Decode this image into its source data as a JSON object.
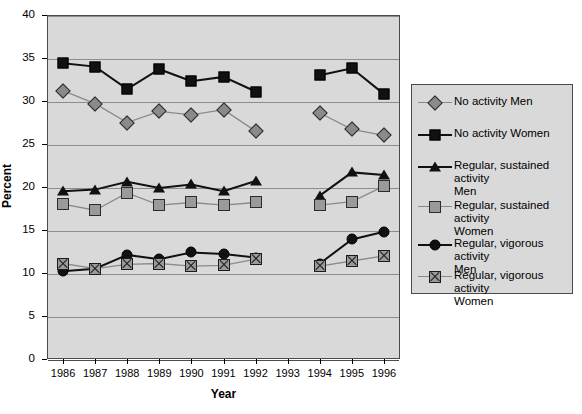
{
  "axes": {
    "y_label": "Percent",
    "x_label": "Year",
    "y_ticks": [
      "0",
      "5",
      "10",
      "15",
      "20",
      "25",
      "30",
      "35",
      "40"
    ],
    "x_ticks": [
      "1986",
      "1987",
      "1988",
      "1989",
      "1990",
      "1991",
      "1992",
      "1993",
      "1994",
      "1995",
      "1996"
    ]
  },
  "legend": {
    "items": [
      {
        "label": "No activity Men",
        "marker": "diamond-gray",
        "line_color": "#8a8a8a"
      },
      {
        "label": "No activity Women",
        "marker": "square-black",
        "line_color": "#111111"
      },
      {
        "label": "Regular, sustained activity\nMen",
        "marker": "triangle-black",
        "line_color": "#111111"
      },
      {
        "label": "Regular, sustained activity\nWomen",
        "marker": "square-gray",
        "line_color": "#8a8a8a"
      },
      {
        "label": "Regular, vigorous activity\nMen",
        "marker": "circle-black",
        "line_color": "#111111"
      },
      {
        "label": "Regular, vigorous activity\nWomen",
        "marker": "square-crossed-gray",
        "line_color": "#8a8a8a"
      }
    ]
  },
  "chart_data": {
    "type": "line",
    "title": "",
    "xlabel": "Year",
    "ylabel": "Percent",
    "ylim": [
      0,
      40
    ],
    "ytick_step": 5,
    "grid": true,
    "legend_position": "right",
    "x": [
      1986,
      1987,
      1988,
      1989,
      1990,
      1991,
      1992,
      1993,
      1994,
      1995,
      1996
    ],
    "note": "No data plotted for 1993 (gap in all series)",
    "series": [
      {
        "name": "No activity Men",
        "marker": "diamond-gray",
        "color": "#8a8a8a",
        "values": [
          31.2,
          29.7,
          27.5,
          28.8,
          28.4,
          29.0,
          26.5,
          null,
          28.6,
          26.7,
          26.0
        ]
      },
      {
        "name": "No activity Women",
        "marker": "square-black",
        "color": "#111111",
        "values": [
          34.4,
          34.0,
          31.4,
          33.7,
          32.3,
          32.8,
          31.1,
          null,
          33.0,
          33.8,
          30.8
        ]
      },
      {
        "name": "Regular, sustained activity Men",
        "marker": "triangle-black",
        "color": "#111111",
        "values": [
          19.5,
          19.7,
          20.6,
          19.9,
          20.3,
          19.5,
          20.7,
          null,
          19.0,
          21.7,
          21.4
        ]
      },
      {
        "name": "Regular, sustained activity Women",
        "marker": "square-gray",
        "color": "#8a8a8a",
        "values": [
          18.0,
          17.3,
          19.3,
          17.9,
          18.2,
          17.9,
          18.2,
          null,
          17.9,
          18.3,
          20.1
        ]
      },
      {
        "name": "Regular, vigorous activity Men",
        "marker": "circle-black",
        "color": "#111111",
        "values": [
          10.2,
          10.5,
          12.1,
          11.6,
          12.4,
          12.2,
          11.8,
          null,
          11.1,
          13.9,
          14.8
        ]
      },
      {
        "name": "Regular, vigorous activity Women",
        "marker": "square-crossed-gray",
        "color": "#8a8a8a",
        "values": [
          11.1,
          10.5,
          11.0,
          11.1,
          10.8,
          10.9,
          11.6,
          null,
          10.8,
          11.4,
          12.0
        ]
      }
    ]
  }
}
